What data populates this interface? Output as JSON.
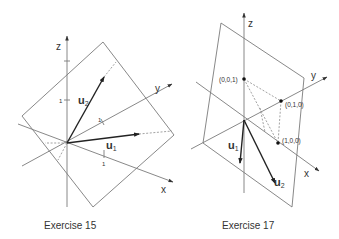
{
  "figures": [
    {
      "caption": "Exercise 15",
      "axes": {
        "x": "x",
        "y": "y",
        "z": "z"
      },
      "tick_labels": {
        "z": "1",
        "y": "1",
        "x": "1"
      },
      "vectors": {
        "u1": {
          "letter": "u",
          "sub": "1"
        },
        "u2": {
          "letter": "u",
          "sub": "2"
        }
      }
    },
    {
      "caption": "Exercise 17",
      "axes": {
        "x": "x",
        "y": "y",
        "z": "z"
      },
      "points": {
        "p001": "(0,0,1)",
        "p010": "(0,1,0)",
        "p100": "(1,0,0)"
      },
      "vectors": {
        "u1": {
          "letter": "u",
          "sub": "1"
        },
        "u2": {
          "letter": "u",
          "sub": "2"
        }
      }
    }
  ],
  "colors": {
    "line": "#7a7a7a",
    "vector": "#222222",
    "text": "#333333"
  }
}
